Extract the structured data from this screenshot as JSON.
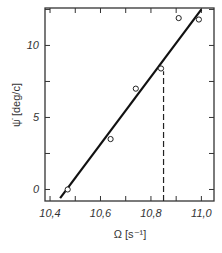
{
  "chart_data": {
    "type": "scatter",
    "title": "",
    "xlabel": "Ω [s⁻¹]",
    "ylabel": "ψ̇ [deg/c]",
    "xlim": [
      10.38,
      11.05
    ],
    "ylim": [
      -0.8,
      12.6
    ],
    "x_ticks": [
      10.4,
      10.6,
      10.8,
      11.0
    ],
    "x_tick_labels": [
      "10,4",
      "10,6",
      "10,8",
      "11,0"
    ],
    "y_ticks": [
      0,
      5,
      10
    ],
    "y_tick_labels": [
      "0",
      "5",
      "10"
    ],
    "grid": false,
    "series": [
      {
        "name": "measured",
        "marker": "open-circle",
        "x": [
          10.47,
          10.64,
          10.74,
          10.84,
          10.91,
          10.99
        ],
        "y": [
          0.0,
          3.5,
          7.0,
          8.4,
          11.9,
          11.8
        ]
      },
      {
        "name": "linear fit",
        "style": "solid-line",
        "x": [
          10.44,
          11.0
        ],
        "y": [
          -0.6,
          12.5
        ]
      },
      {
        "name": "marker line",
        "style": "dashed-vertical",
        "x": [
          10.85,
          10.85
        ],
        "y": [
          -0.8,
          8.2
        ]
      }
    ]
  }
}
